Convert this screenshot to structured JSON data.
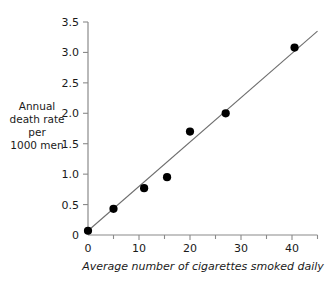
{
  "chart_data": {
    "type": "scatter",
    "title": "",
    "xlabel": "Average number of cigarettes smoked daily",
    "ylabel": "Annual death rate per 1000 men",
    "ylabel_lines": [
      "Annual",
      "death rate",
      "per",
      "1000 men"
    ],
    "xlim": [
      0,
      45
    ],
    "ylim": [
      0,
      3.5
    ],
    "grid": false,
    "legend": "none",
    "x_ticks": [
      0,
      10,
      20,
      30,
      40
    ],
    "x_tick_labels": [
      "0",
      "10",
      "20",
      "30",
      "40"
    ],
    "x_minor_ticks": [
      5,
      15,
      25,
      35,
      45
    ],
    "y_ticks": [
      0,
      0.5,
      1.0,
      1.5,
      2.0,
      2.5,
      3.0,
      3.5
    ],
    "y_tick_labels": [
      "0",
      "0.5",
      "1.0",
      "1.5",
      "2.0",
      "2.5",
      "3.0",
      "3.5"
    ],
    "points": [
      {
        "x": 0,
        "y": 0.07
      },
      {
        "x": 5,
        "y": 0.43
      },
      {
        "x": 11,
        "y": 0.77
      },
      {
        "x": 15.5,
        "y": 0.95
      },
      {
        "x": 20,
        "y": 1.7
      },
      {
        "x": 27,
        "y": 2.0
      },
      {
        "x": 40.5,
        "y": 3.08
      }
    ],
    "trendline": {
      "name": "fitted line",
      "x_start": 0,
      "y_start": 0.07,
      "x_end": 45,
      "y_end": 3.35
    },
    "colors": {
      "point": "#000000",
      "line": "#6e6e6e",
      "axis": "#8a8a8a",
      "background": "#ffffff",
      "text": "#1a1a1a"
    }
  }
}
